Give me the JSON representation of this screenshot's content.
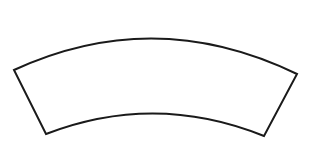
{
  "canvas": {
    "width": 311,
    "height": 150,
    "background_color": "#ffffff",
    "title": "Curved Band Shape"
  },
  "shape": {
    "name": "curved band",
    "kind": "annular-sector",
    "description": "Unfilled curved band (arch segment) outline, concave downward",
    "fill_color": "#ffffff",
    "stroke_color": "#1a1a1a",
    "stroke_width": 2,
    "outer_arc": {
      "start": [
        14,
        70
      ],
      "apex": [
        155,
        26
      ],
      "end": [
        297,
        74
      ],
      "control": [
        155,
        5
      ]
    },
    "inner_arc": {
      "start": [
        264,
        136
      ],
      "apex": [
        155,
        108
      ],
      "end": [
        46,
        134
      ],
      "control": [
        155,
        92
      ]
    },
    "left_end_cap": {
      "from": [
        14,
        70
      ],
      "to": [
        46,
        134
      ]
    },
    "right_end_cap": {
      "from": [
        297,
        74
      ],
      "to": [
        264,
        136
      ]
    },
    "path_d": "M 14 70 Q 155 5 297 74 L 264 136 Q 155 92 46 134 Z"
  }
}
